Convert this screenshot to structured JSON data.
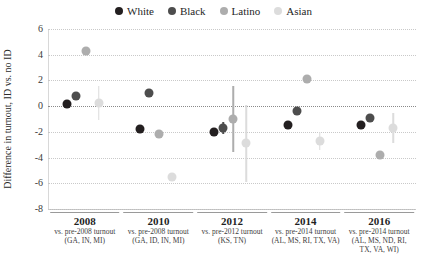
{
  "chart_data": {
    "type": "scatter",
    "title": "",
    "xlabel": "",
    "ylabel": "Difference in turnout, ID vs. no ID",
    "ylim": [
      -8,
      6
    ],
    "yticks": [
      6,
      4,
      2,
      0,
      -2,
      -4,
      -6,
      -8
    ],
    "ytick_labels": [
      "6",
      "4",
      "2",
      "0",
      "-2",
      "-4",
      "-6",
      "-8"
    ],
    "grid": true,
    "legend_position": "top-center",
    "categories": [
      "2008",
      "2010",
      "2012",
      "2014",
      "2016"
    ],
    "group_subtitles": [
      "vs. pre-2008 turnout",
      "vs. pre-2008 turnout",
      "vs. pre-2012 turnout",
      "vs. pre-2014 turnout",
      "vs. pre-2014 turnout"
    ],
    "group_states": [
      "(GA, IN, MI)",
      "(GA, ID, IN, MI)",
      "(KS, TN)",
      "(AL, MS, RI, TX, VA)",
      "(AL, MS, ND, RI,\nTX, VA, WI)"
    ],
    "series": [
      {
        "name": "White",
        "color": "#231f20",
        "values": [
          0.2,
          -1.8,
          -2.0,
          -1.5,
          -1.5
        ],
        "errors": [
          0.0,
          0.0,
          0.0,
          0.0,
          0.0
        ]
      },
      {
        "name": "Black",
        "color": "#4d4d4d",
        "values": [
          0.8,
          1.0,
          -1.7,
          -0.4,
          -0.9
        ],
        "errors": [
          0.0,
          0.0,
          0.5,
          0.0,
          0.0
        ]
      },
      {
        "name": "Latino",
        "color": "#adadad",
        "values": [
          4.3,
          -2.2,
          -1.0,
          2.1,
          -3.8
        ],
        "errors": [
          0.0,
          0.0,
          2.6,
          0.0,
          0.0
        ]
      },
      {
        "name": "Asian",
        "color": "#dcdcdc",
        "values": [
          0.25,
          -5.5,
          -2.9,
          -2.7,
          -1.7
        ],
        "errors": [
          1.3,
          0.0,
          3.0,
          0.7,
          1.2
        ]
      }
    ]
  },
  "legend": {
    "items": [
      {
        "label": "White",
        "color": "#231f20"
      },
      {
        "label": "Black",
        "color": "#4d4d4d"
      },
      {
        "label": "Latino",
        "color": "#adadad"
      },
      {
        "label": "Asian",
        "color": "#dcdcdc"
      }
    ]
  }
}
